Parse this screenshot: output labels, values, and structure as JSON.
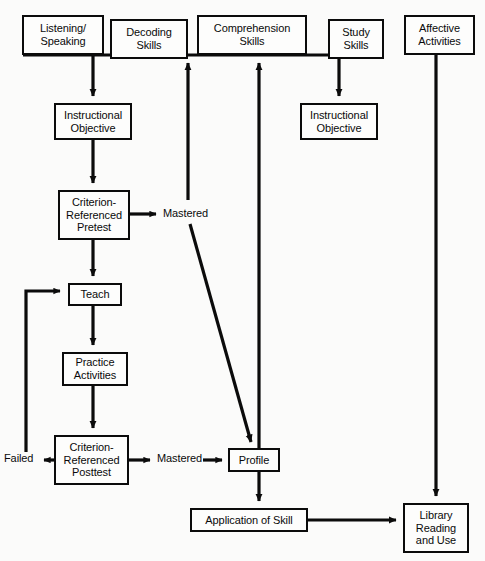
{
  "diagram": {
    "background_color": "#fbfbfa",
    "line_color": "#0b0b0b",
    "text_color": "#0a0a0a",
    "nodes": [
      {
        "id": "listening-speaking",
        "label": "Listening/\nSpeaking",
        "x": 22,
        "y": 15,
        "w": 82,
        "h": 40
      },
      {
        "id": "decoding-skills",
        "label": "Decoding\nSkills",
        "x": 110,
        "y": 19,
        "w": 78,
        "h": 40
      },
      {
        "id": "comprehension-skills",
        "label": "Comprehension\nSkills",
        "x": 197,
        "y": 15,
        "w": 110,
        "h": 40
      },
      {
        "id": "study-skills",
        "label": "Study\nSkills",
        "x": 328,
        "y": 19,
        "w": 56,
        "h": 40
      },
      {
        "id": "affective-activities",
        "label": "Affective\nActivities",
        "x": 404,
        "y": 15,
        "w": 71,
        "h": 40
      },
      {
        "id": "instructional-objective-left",
        "label": "Instructional\nObjective",
        "x": 54,
        "y": 103,
        "w": 78,
        "h": 37
      },
      {
        "id": "instructional-objective-right",
        "label": "Instructional\nObjective",
        "x": 300,
        "y": 103,
        "w": 78,
        "h": 37
      },
      {
        "id": "criterion-referenced-pretest",
        "label": "Criterion-\nReferenced\nPretest",
        "x": 58,
        "y": 190,
        "w": 72,
        "h": 50
      },
      {
        "id": "teach",
        "label": "Teach",
        "x": 68,
        "y": 283,
        "w": 54,
        "h": 23
      },
      {
        "id": "practice-activities",
        "label": "Practice\nActivities",
        "x": 62,
        "y": 352,
        "w": 66,
        "h": 34
      },
      {
        "id": "criterion-referenced-posttest",
        "label": "Criterion-\nReferenced\nPosttest",
        "x": 54,
        "y": 435,
        "w": 75,
        "h": 50
      },
      {
        "id": "profile",
        "label": "Profile",
        "x": 228,
        "y": 448,
        "w": 52,
        "h": 24
      },
      {
        "id": "application-of-skill",
        "label": "Application of Skill",
        "x": 190,
        "y": 508,
        "w": 118,
        "h": 24
      },
      {
        "id": "library-reading-and-use",
        "label": "Library\nReading\nand Use",
        "x": 403,
        "y": 503,
        "w": 66,
        "h": 50
      }
    ],
    "edge_labels": [
      {
        "id": "mastered-pretest",
        "text": "Mastered",
        "x": 163,
        "y": 208
      },
      {
        "id": "failed-posttest",
        "text": "Failed",
        "x": 4,
        "y": 453
      },
      {
        "id": "mastered-posttest",
        "text": "Mastered",
        "x": 157,
        "y": 453
      }
    ],
    "connectors": [
      {
        "id": "skill-strand-bus",
        "from": "listening-speaking",
        "to": "study-skills",
        "type": "horizontal-bus"
      },
      {
        "id": "listening-to-objective",
        "from": "listening-speaking",
        "to": "instructional-objective-left",
        "type": "arrow-down"
      },
      {
        "id": "study-to-objective",
        "from": "study-skills",
        "to": "instructional-objective-right",
        "type": "arrow-down"
      },
      {
        "id": "objective-to-pretest",
        "from": "instructional-objective-left",
        "to": "criterion-referenced-pretest",
        "type": "arrow-down"
      },
      {
        "id": "pretest-to-mastered",
        "from": "criterion-referenced-pretest",
        "to": "mastered-pretest",
        "type": "arrow-right"
      },
      {
        "id": "pretest-to-teach",
        "from": "criterion-referenced-pretest",
        "to": "teach",
        "type": "arrow-down"
      },
      {
        "id": "mastered-to-decoding",
        "from": "mastered-pretest",
        "to": "decoding-skills",
        "type": "arrow-up"
      },
      {
        "id": "mastered-to-profile",
        "from": "mastered-pretest",
        "to": "profile",
        "type": "arrow-diagonal"
      },
      {
        "id": "teach-to-practice",
        "from": "teach",
        "to": "practice-activities",
        "type": "arrow-down"
      },
      {
        "id": "practice-to-posttest",
        "from": "practice-activities",
        "to": "criterion-referenced-posttest",
        "type": "arrow-down"
      },
      {
        "id": "posttest-to-failed",
        "from": "criterion-referenced-posttest",
        "to": "failed-posttest",
        "type": "arrow-left"
      },
      {
        "id": "failed-to-teach",
        "from": "failed-posttest",
        "to": "teach",
        "type": "arrow-loop-up"
      },
      {
        "id": "posttest-to-mastered",
        "from": "criterion-referenced-posttest",
        "to": "mastered-posttest",
        "type": "arrow-right"
      },
      {
        "id": "mastered-to-profile-2",
        "from": "mastered-posttest",
        "to": "profile",
        "type": "arrow-right"
      },
      {
        "id": "profile-to-comprehension",
        "from": "profile",
        "to": "comprehension-skills",
        "type": "arrow-up"
      },
      {
        "id": "profile-to-application",
        "from": "profile",
        "to": "application-of-skill",
        "type": "arrow-down"
      },
      {
        "id": "application-to-library",
        "from": "application-of-skill",
        "to": "library-reading-and-use",
        "type": "arrow-right"
      },
      {
        "id": "affective-to-library",
        "from": "affective-activities",
        "to": "library-reading-and-use",
        "type": "arrow-down"
      }
    ]
  }
}
